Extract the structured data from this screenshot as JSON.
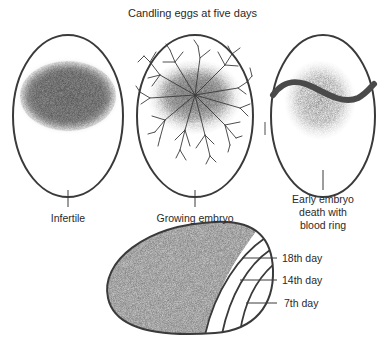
{
  "title": "Candling eggs at five days",
  "eggs": [
    {
      "id": "infertile",
      "label": "Infertile"
    },
    {
      "id": "growing-embryo",
      "label": "Growing embryo"
    },
    {
      "id": "early-death",
      "label_lines": [
        "Early embryo",
        "death with",
        "blood ring"
      ]
    }
  ],
  "air_cell": {
    "labels": [
      "18th day",
      "14th day",
      "7th day"
    ]
  },
  "colors": {
    "outline": "#3a3a3a",
    "shading": "#6e6e6e",
    "blood_ring": "#4a4a4a",
    "background": "#ffffff"
  }
}
